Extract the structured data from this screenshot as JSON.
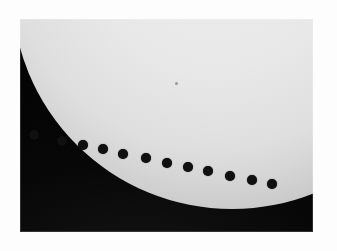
{
  "photo": {
    "subject": "venus-transit-composite",
    "frame": {
      "x": 20,
      "y": 19,
      "width": 293,
      "height": 213
    },
    "background_color": "#ffffff",
    "sky_color": "#070707",
    "disk_color": "#f0f0f0",
    "silhouette_color": "#101010",
    "alt_text": "Composite photograph of a planetary transit: a row of small dark dots crossing the lower limb of the bright solar disk against a black sky"
  },
  "sun": {
    "name": "solar-disk",
    "center_x": 212,
    "center_y": -31,
    "radius": 220,
    "limb_darkening": true
  },
  "sunspot": {
    "name": "sunspot",
    "x": 175,
    "y": 82,
    "size": 3
  },
  "chart_data": {
    "type": "scatter",
    "title": "",
    "xlabel": "",
    "ylabel": "",
    "grid": false,
    "legend": "none",
    "series": [
      {
        "name": "transit-silhouettes",
        "marker": "filled-circle",
        "marker_color": "#101010",
        "marker_size": 9,
        "points": [
          {
            "label": "pos-1",
            "x": 34,
            "y": 135,
            "d": 10
          },
          {
            "label": "pos-2",
            "x": 62,
            "y": 141,
            "d": 10
          },
          {
            "label": "pos-3",
            "x": 83,
            "y": 145,
            "d": 10
          },
          {
            "label": "pos-4",
            "x": 103,
            "y": 149,
            "d": 10
          },
          {
            "label": "pos-5",
            "x": 123,
            "y": 154,
            "d": 10
          },
          {
            "label": "pos-6",
            "x": 146,
            "y": 158,
            "d": 10
          },
          {
            "label": "pos-7",
            "x": 167,
            "y": 163,
            "d": 10
          },
          {
            "label": "pos-8",
            "x": 188,
            "y": 167,
            "d": 10
          },
          {
            "label": "pos-9",
            "x": 208,
            "y": 171,
            "d": 10
          },
          {
            "label": "pos-10",
            "x": 230,
            "y": 176,
            "d": 10
          },
          {
            "label": "pos-11",
            "x": 252,
            "y": 180,
            "d": 10
          },
          {
            "label": "pos-12",
            "x": 272,
            "y": 184,
            "d": 10
          }
        ]
      }
    ]
  }
}
